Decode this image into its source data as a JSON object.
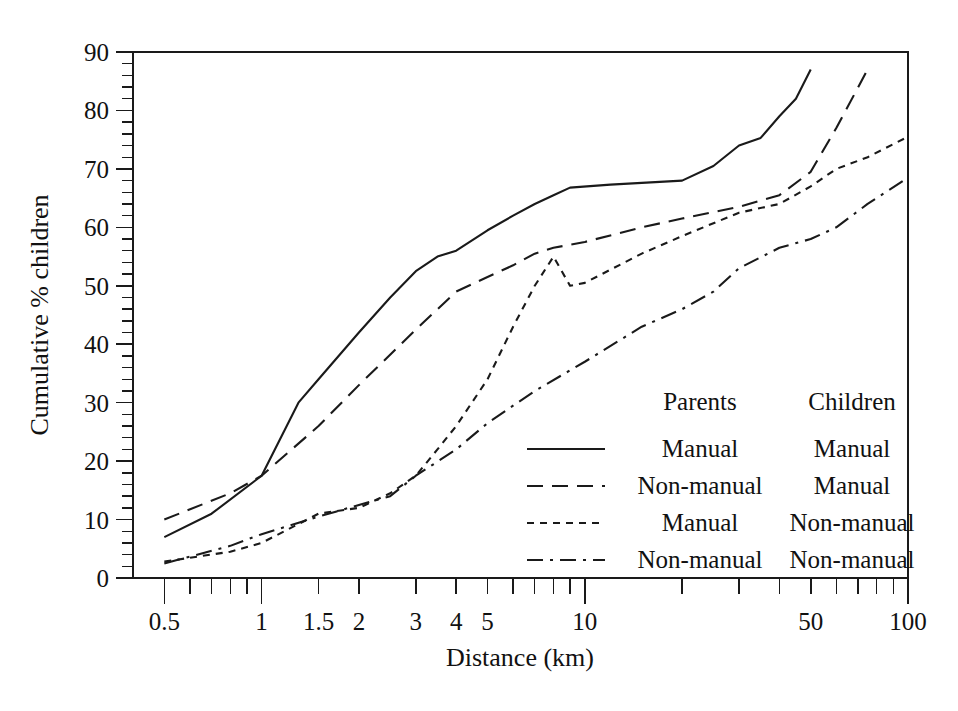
{
  "chart_data": {
    "type": "line",
    "title": "",
    "xlabel": "Distance (km)",
    "ylabel": "Cumulative % children",
    "xscale": "log",
    "xlim": [
      0.4,
      100
    ],
    "ylim": [
      0,
      90
    ],
    "grid": false,
    "legend_position": "inside-lower-right",
    "xticks_labeled": [
      {
        "value": 0.5,
        "label": "0.5"
      },
      {
        "value": 1,
        "label": "1"
      },
      {
        "value": 1.5,
        "label": "1.5"
      },
      {
        "value": 2,
        "label": "2"
      },
      {
        "value": 3,
        "label": "3"
      },
      {
        "value": 4,
        "label": "4"
      },
      {
        "value": 5,
        "label": "5"
      },
      {
        "value": 10,
        "label": "10"
      },
      {
        "value": 50,
        "label": "50"
      },
      {
        "value": 100,
        "label": "100"
      }
    ],
    "xticks_minor": [
      0.6,
      0.7,
      0.8,
      0.9,
      6,
      7,
      8,
      9,
      20,
      30,
      40,
      60,
      70,
      80,
      90
    ],
    "yticks_labeled": [
      0,
      10,
      20,
      30,
      40,
      50,
      60,
      70,
      80,
      90
    ],
    "ytick_minor_step": 2,
    "legend_headers": [
      "Parents",
      "Children"
    ],
    "series": [
      {
        "name": "manual-manual",
        "parents": "Manual",
        "children": "Manual",
        "style": "solid",
        "points": [
          [
            0.5,
            7.0
          ],
          [
            0.7,
            11.0
          ],
          [
            1.0,
            17.5
          ],
          [
            1.3,
            30.0
          ],
          [
            1.5,
            34.0
          ],
          [
            2.0,
            42.0
          ],
          [
            2.5,
            48.0
          ],
          [
            3.0,
            52.5
          ],
          [
            3.5,
            55.0
          ],
          [
            4.0,
            56.0
          ],
          [
            5.0,
            59.5
          ],
          [
            6.0,
            62.0
          ],
          [
            7.0,
            64.0
          ],
          [
            8.0,
            65.5
          ],
          [
            9.0,
            66.8
          ],
          [
            12.0,
            67.3
          ],
          [
            20.0,
            68.0
          ],
          [
            25.0,
            70.5
          ],
          [
            30.0,
            74.0
          ],
          [
            35.0,
            75.3
          ],
          [
            40.0,
            79.0
          ],
          [
            45.0,
            82.0
          ],
          [
            50.0,
            87.0
          ]
        ]
      },
      {
        "name": "nonmanual-manual",
        "parents": "Non-manual",
        "children": "Manual",
        "style": "dashed",
        "points": [
          [
            0.5,
            10.0
          ],
          [
            0.8,
            14.5
          ],
          [
            1.0,
            17.5
          ],
          [
            1.5,
            26.0
          ],
          [
            2.0,
            33.0
          ],
          [
            3.0,
            42.5
          ],
          [
            4.0,
            49.0
          ],
          [
            5.0,
            51.5
          ],
          [
            6.0,
            53.5
          ],
          [
            7.0,
            55.5
          ],
          [
            8.0,
            56.5
          ],
          [
            10.0,
            57.5
          ],
          [
            15.0,
            60.0
          ],
          [
            20.0,
            61.5
          ],
          [
            30.0,
            63.5
          ],
          [
            40.0,
            65.5
          ],
          [
            50.0,
            69.5
          ],
          [
            60.0,
            77.0
          ],
          [
            75.0,
            87.0
          ]
        ]
      },
      {
        "name": "manual-nonmanual",
        "parents": "Manual",
        "children": "Non-manual",
        "style": "dotted",
        "points": [
          [
            0.5,
            2.8
          ],
          [
            0.8,
            4.5
          ],
          [
            1.0,
            6.0
          ],
          [
            1.5,
            11.0
          ],
          [
            2.0,
            12.0
          ],
          [
            2.5,
            14.5
          ],
          [
            3.0,
            17.5
          ],
          [
            3.5,
            22.0
          ],
          [
            4.0,
            26.0
          ],
          [
            5.0,
            34.0
          ],
          [
            6.0,
            43.0
          ],
          [
            7.0,
            50.0
          ],
          [
            8.0,
            55.0
          ],
          [
            9.0,
            50.0
          ],
          [
            10.0,
            50.5
          ],
          [
            15.0,
            55.5
          ],
          [
            20.0,
            58.5
          ],
          [
            30.0,
            62.5
          ],
          [
            40.0,
            64.0
          ],
          [
            50.0,
            67.0
          ],
          [
            60.0,
            70.0
          ],
          [
            75.0,
            72.0
          ],
          [
            100.0,
            75.5
          ]
        ]
      },
      {
        "name": "nonmanual-nonmanual",
        "parents": "Non-manual",
        "children": "Non-manual",
        "style": "dashdot",
        "points": [
          [
            0.5,
            2.5
          ],
          [
            0.8,
            5.5
          ],
          [
            1.0,
            7.5
          ],
          [
            1.5,
            10.5
          ],
          [
            2.0,
            12.5
          ],
          [
            2.5,
            14.0
          ],
          [
            3.0,
            17.5
          ],
          [
            4.0,
            22.0
          ],
          [
            5.0,
            26.5
          ],
          [
            7.0,
            32.0
          ],
          [
            10.0,
            37.0
          ],
          [
            15.0,
            43.0
          ],
          [
            20.0,
            46.0
          ],
          [
            25.0,
            49.0
          ],
          [
            30.0,
            53.0
          ],
          [
            40.0,
            56.5
          ],
          [
            50.0,
            58.0
          ],
          [
            60.0,
            60.0
          ],
          [
            75.0,
            64.0
          ],
          [
            100.0,
            68.5
          ]
        ]
      }
    ]
  },
  "legend": {
    "header_parents": "Parents",
    "header_children": "Children",
    "rows": [
      {
        "style": "solid",
        "parents": "Manual",
        "children": "Manual"
      },
      {
        "style": "dashed",
        "parents": "Non-manual",
        "children": "Manual"
      },
      {
        "style": "dotted",
        "parents": "Manual",
        "children": "Non-manual"
      },
      {
        "style": "dashdot",
        "parents": "Non-manual",
        "children": "Non-manual"
      }
    ]
  },
  "axes": {
    "x_title": "Distance (km)",
    "y_title": "Cumulative % children"
  }
}
